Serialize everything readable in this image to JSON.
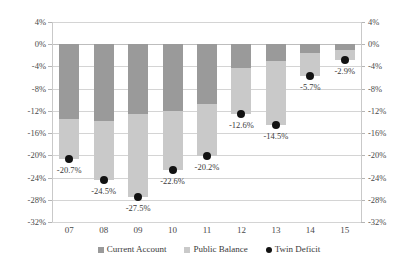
{
  "chart_data": {
    "type": "bar",
    "title": "",
    "subtitle": "",
    "xlabel": "",
    "ylabel": "",
    "stacked": true,
    "grid": true,
    "legend_position": "bottom",
    "ylim": [
      -32,
      4
    ],
    "yticks": [
      4,
      0,
      -4,
      -8,
      -12,
      -16,
      -20,
      -24,
      -28,
      -32
    ],
    "ytick_labels": [
      "4%",
      "0%",
      "-4%",
      "-8%",
      "-12%",
      "-16%",
      "-20%",
      "-24%",
      "-28%",
      "-32%"
    ],
    "ytick_labels_right": [
      "4%",
      "0%",
      "-4%",
      "-8%",
      "-12%",
      "-16%",
      "-20%",
      "-24%",
      "-28%",
      "-32%"
    ],
    "dual_axis": true,
    "categories": [
      "07",
      "08",
      "09",
      "10",
      "11",
      "12",
      "13",
      "14",
      "15"
    ],
    "series": [
      {
        "name": "Current Account",
        "type": "bar",
        "color": "#9a9a9a",
        "values": [
          -13.5,
          -13.9,
          -12.5,
          -12.1,
          -10.8,
          -4.3,
          -3.1,
          -1.5,
          -1.1
        ]
      },
      {
        "name": "Public Balance",
        "type": "bar",
        "color": "#c9c9c9",
        "values": [
          -7.2,
          -10.6,
          -15.0,
          -10.5,
          -9.4,
          -8.3,
          -11.4,
          -4.2,
          -1.8
        ]
      },
      {
        "name": "Twin Deficit",
        "type": "scatter",
        "color": "#121212",
        "values": [
          -20.7,
          -24.5,
          -27.5,
          -22.6,
          -20.2,
          -12.6,
          -14.5,
          -5.7,
          -2.9
        ],
        "labels": [
          "-20.7%",
          "-24.5%",
          "-27.5%",
          "-22.6%",
          "-20.2%",
          "-12.6%",
          "-14.5%",
          "-5.7%",
          "-2.9%"
        ]
      }
    ]
  },
  "legend": {
    "items": [
      {
        "label": "Current Account",
        "marker": "square-swatch-dark"
      },
      {
        "label": "Public Balance",
        "marker": "square-swatch-light"
      },
      {
        "label": "Twin Deficit",
        "marker": "circle-marker-black"
      }
    ]
  },
  "colors": {
    "current_account": "#9a9a9a",
    "public_balance": "#c9c9c9",
    "twin_deficit": "#121212",
    "gridline": "#d4d4d4",
    "axis": "#c9c9c9",
    "background": "#ffffff"
  }
}
